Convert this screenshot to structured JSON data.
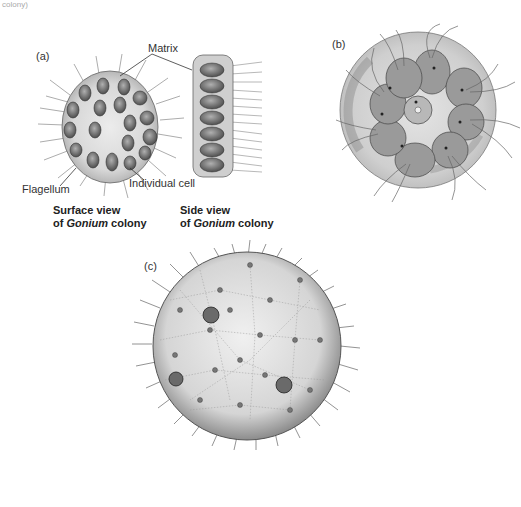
{
  "fragment_top": "colony)",
  "panels": {
    "a": {
      "label": "(a)",
      "labels": {
        "matrix": "Matrix",
        "flagellum": "Flagellum",
        "individual_cell": "Individual cell"
      },
      "captions": {
        "surface": {
          "line1": "Surface view",
          "pre": "of ",
          "genus": "Gonium",
          "post": " colony"
        },
        "side": {
          "line1": "Side view",
          "pre": "of ",
          "genus": "Gonium",
          "post": " colony"
        }
      }
    },
    "b": {
      "label": "(b)"
    },
    "c": {
      "label": "(c)"
    }
  },
  "colors": {
    "matrix_fill": "#d9d9d9",
    "cell_fill": "#8a8a8a",
    "outline": "#555555",
    "flagella": "#777777"
  }
}
